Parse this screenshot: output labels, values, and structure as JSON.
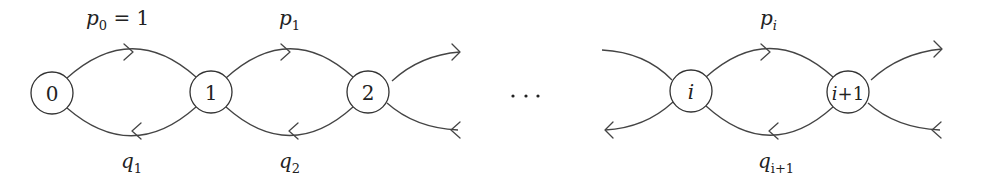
{
  "diagram": {
    "type": "birth-death chain",
    "nodes": [
      {
        "id": "0",
        "label": "0",
        "cx": 52,
        "cy": 93
      },
      {
        "id": "1",
        "label": "1",
        "cx": 211,
        "cy": 92
      },
      {
        "id": "2",
        "label": "2",
        "cx": 368,
        "cy": 92
      },
      {
        "id": "i",
        "label": "i",
        "cx": 691,
        "cy": 91
      },
      {
        "id": "i+1",
        "label": "i+1",
        "cx": 848,
        "cy": 92
      }
    ],
    "ellipsis": "⋯",
    "labels": {
      "p0": {
        "base": "p",
        "sub": "0",
        "suffix": " = 1"
      },
      "p1": {
        "base": "p",
        "sub": "1"
      },
      "pi": {
        "base": "p",
        "sub": "i"
      },
      "q1": {
        "base": "q",
        "sub": "1"
      },
      "q2": {
        "base": "q",
        "sub": "2"
      },
      "qi1": {
        "base": "q",
        "sub": "i+1"
      }
    },
    "edges": [
      {
        "from": "0",
        "to": "1",
        "label": "p_0 = 1",
        "direction": "forward"
      },
      {
        "from": "1",
        "to": "0",
        "label": "q_1",
        "direction": "backward"
      },
      {
        "from": "1",
        "to": "2",
        "label": "p_1",
        "direction": "forward"
      },
      {
        "from": "2",
        "to": "1",
        "label": "q_2",
        "direction": "backward"
      },
      {
        "from": "2",
        "to": "3",
        "label": "",
        "direction": "forward"
      },
      {
        "from": "3",
        "to": "2",
        "label": "",
        "direction": "backward"
      },
      {
        "from": "i-1",
        "to": "i",
        "label": "",
        "direction": "forward"
      },
      {
        "from": "i",
        "to": "i-1",
        "label": "",
        "direction": "backward"
      },
      {
        "from": "i",
        "to": "i+1",
        "label": "p_i",
        "direction": "forward"
      },
      {
        "from": "i+1",
        "to": "i",
        "label": "q_{i+1}",
        "direction": "backward"
      },
      {
        "from": "i+1",
        "to": "i+2",
        "label": "",
        "direction": "forward"
      },
      {
        "from": "i+2",
        "to": "i+1",
        "label": "",
        "direction": "backward"
      }
    ]
  }
}
